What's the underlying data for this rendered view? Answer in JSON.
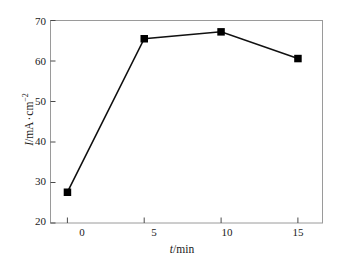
{
  "chart_data": {
    "type": "line",
    "title": "",
    "subtitle": "",
    "xlabel": "t/min",
    "ylabel": "I/mA · cm⁻²",
    "xlabel_parts": {
      "italic": "t",
      "rest": "/min"
    },
    "ylabel_parts": {
      "italic": "I",
      "rest": "/mA",
      "middot": "·",
      "unit": "cm",
      "exponent": "−2"
    },
    "x": [
      0,
      5,
      10,
      15
    ],
    "values": [
      27.6,
      65.5,
      67.2,
      60.6
    ],
    "series": [
      {
        "name": "current density",
        "x": [
          0,
          5,
          10,
          15
        ],
        "values": [
          27.6,
          65.5,
          67.2,
          60.6
        ]
      }
    ],
    "xlim": [
      -1.1,
      16.6
    ],
    "ylim": [
      20,
      70
    ],
    "xticks": [
      0,
      5,
      10,
      15
    ],
    "xtick_labels": [
      "0",
      "5",
      "10",
      "15"
    ],
    "yticks": [
      20,
      30,
      40,
      50,
      60,
      70
    ],
    "ytick_labels": [
      "20",
      "30",
      "40",
      "50",
      "60",
      "70"
    ],
    "grid": false,
    "legend": false,
    "legend_position": "none",
    "marker": "square",
    "marker_color": "#000000",
    "line_color": "#000000",
    "frame_color": "#8a8a8a",
    "background_color": "#ffffff",
    "annotations": []
  },
  "figure": {
    "caption": ""
  }
}
